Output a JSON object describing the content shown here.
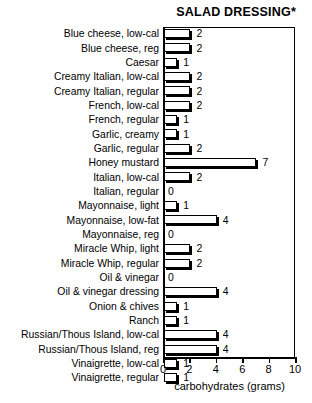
{
  "chart_data": {
    "type": "bar",
    "orientation": "horizontal",
    "title": "SALAD DRESSING*",
    "xlabel": "carbohydrates (grams)",
    "ylabel": "",
    "xlim": [
      0,
      10
    ],
    "xticks": [
      0,
      2,
      4,
      6,
      8,
      10
    ],
    "xtick_labels": [
      "0",
      "2",
      "4",
      "6",
      "8",
      "10"
    ],
    "grid": false,
    "legend": null,
    "categories": [
      "Blue cheese, low-cal",
      "Blue cheese, reg",
      "Caesar",
      "Creamy Italian, low-cal",
      "Creamy Italian, regular",
      "French, low-cal",
      "French, regular",
      "Garlic, creamy",
      "Garlic, regular",
      "Honey mustard",
      "Italian, low-cal",
      "Italian, regular",
      "Mayonnaise, light",
      "Mayonnaise, low-fat",
      "Mayonnaise, reg",
      "Miracle Whip, light",
      "Miracle Whip, regular",
      "Oil & vinegar",
      "Oil & vinegar dressing",
      "Onion & chives",
      "Ranch",
      "Russian/Thous Island, low-cal",
      "Russian/Thous Island, reg",
      "Vinaigrette, low-cal",
      "Vinaigrette, regular"
    ],
    "values": [
      2,
      2,
      1,
      2,
      2,
      2,
      1,
      1,
      2,
      7,
      2,
      0,
      1,
      4,
      0,
      2,
      2,
      0,
      4,
      1,
      1,
      4,
      4,
      1,
      1
    ],
    "value_labels": [
      "2",
      "2",
      "1",
      "2",
      "2",
      "2",
      "1",
      "1",
      "2",
      "7",
      "2",
      "0",
      "1",
      "4",
      "0",
      "2",
      "2",
      "0",
      "4",
      "1",
      "1",
      "4",
      "4",
      "1",
      "1"
    ]
  },
  "colors": {
    "bar_face": "#ffffff",
    "bar_outline": "#000000",
    "bar_shadow": "#000000",
    "axis": "#000000",
    "text": "#000000",
    "background": "#ffffff"
  }
}
